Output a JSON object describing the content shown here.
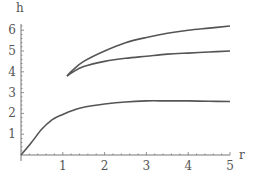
{
  "chart_data": {
    "type": "line",
    "title": "",
    "xlabel": "r",
    "ylabel": "h",
    "xlim": [
      0,
      5
    ],
    "ylim": [
      0,
      6.5
    ],
    "grid": false,
    "legend": null,
    "x_ticks": [
      "1",
      "2",
      "3",
      "4",
      "5"
    ],
    "y_ticks": [
      "1",
      "2",
      "3",
      "4",
      "5",
      "6"
    ],
    "series": [
      {
        "name": "lower curve",
        "x": [
          0,
          0.25,
          0.5,
          0.75,
          1.0,
          1.25,
          1.5,
          2.0,
          2.5,
          3.0,
          3.5,
          4.0,
          4.5,
          5.0
        ],
        "values": [
          0.0,
          0.6,
          1.25,
          1.7,
          1.95,
          2.15,
          2.3,
          2.45,
          2.55,
          2.6,
          2.6,
          2.6,
          2.58,
          2.57
        ]
      },
      {
        "name": "middle curve",
        "x": [
          1.1,
          1.25,
          1.5,
          2.0,
          2.5,
          3.0,
          3.5,
          4.0,
          4.5,
          5.0
        ],
        "values": [
          3.8,
          4.0,
          4.25,
          4.5,
          4.65,
          4.75,
          4.85,
          4.9,
          4.95,
          5.0
        ]
      },
      {
        "name": "upper curve",
        "x": [
          1.1,
          1.25,
          1.5,
          2.0,
          2.5,
          3.0,
          3.5,
          4.0,
          4.5,
          5.0
        ],
        "values": [
          3.8,
          4.1,
          4.5,
          5.0,
          5.4,
          5.65,
          5.85,
          6.0,
          6.1,
          6.2
        ]
      }
    ]
  },
  "colors": {
    "line": "#555555",
    "axis": "#777777",
    "text": "#555555"
  }
}
